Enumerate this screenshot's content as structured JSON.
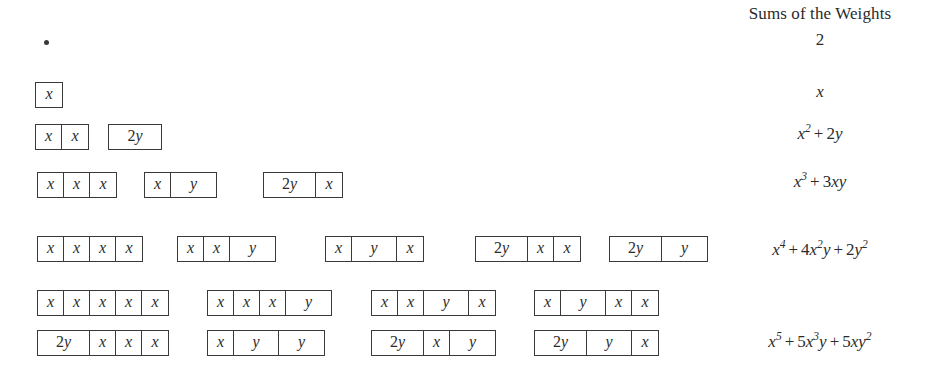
{
  "header": {
    "sums_title": "Sums of the Weights"
  },
  "tile_labels": {
    "x": "x",
    "y": "y",
    "2y_num": "2",
    "2y_var": "y"
  },
  "rows": [
    {
      "id": "row-empty",
      "top": 40,
      "empty_tiling": true,
      "dot_left": 44,
      "groups": [],
      "sum": {
        "top": 30,
        "parts": [
          {
            "type": "mn",
            "text": "2"
          }
        ]
      }
    },
    {
      "id": "row-n1",
      "top": 82,
      "left": 35,
      "groups": [
        {
          "left": 0,
          "cells": [
            "x"
          ]
        }
      ],
      "sum": {
        "top": 82,
        "parts": [
          {
            "type": "mi",
            "text": "x"
          }
        ]
      }
    },
    {
      "id": "row-n2",
      "top": 124,
      "left": 35,
      "groups": [
        {
          "left": 0,
          "cells": [
            "x",
            "x"
          ]
        },
        {
          "left": 73,
          "cells": [
            "2y"
          ]
        }
      ],
      "sum": {
        "top": 124,
        "parts": [
          {
            "type": "mi",
            "text": "x",
            "sup": "2"
          },
          {
            "type": "op",
            "text": "+"
          },
          {
            "type": "mn",
            "text": "2"
          },
          {
            "type": "mi",
            "text": "y"
          }
        ]
      }
    },
    {
      "id": "row-n3",
      "top": 172,
      "left": 37,
      "groups": [
        {
          "left": 0,
          "cells": [
            "x",
            "x",
            "x"
          ]
        },
        {
          "left": 107,
          "cells": [
            "x",
            "y"
          ]
        },
        {
          "left": 226,
          "cells": [
            "2y",
            "x"
          ]
        }
      ],
      "sum": {
        "top": 172,
        "parts": [
          {
            "type": "mi",
            "text": "x",
            "sup": "3"
          },
          {
            "type": "op",
            "text": "+"
          },
          {
            "type": "mn",
            "text": "3"
          },
          {
            "type": "mi",
            "text": "xy"
          }
        ]
      }
    },
    {
      "id": "row-n4",
      "top": 236,
      "left": 37,
      "groups": [
        {
          "left": 0,
          "cells": [
            "x",
            "x",
            "x",
            "x"
          ]
        },
        {
          "left": 140,
          "cells": [
            "x",
            "x",
            "y"
          ]
        },
        {
          "left": 288,
          "cells": [
            "x",
            "y",
            "x"
          ]
        },
        {
          "left": 438,
          "cells": [
            "2y",
            "x",
            "x"
          ]
        },
        {
          "left": 572,
          "cells": [
            "2y",
            "y"
          ]
        }
      ],
      "sum": {
        "top": 240,
        "parts": [
          {
            "type": "mi",
            "text": "x",
            "sup": "4"
          },
          {
            "type": "op",
            "text": "+"
          },
          {
            "type": "mn",
            "text": "4"
          },
          {
            "type": "mi",
            "text": "x",
            "sup": "2"
          },
          {
            "type": "mi",
            "text": "y"
          },
          {
            "type": "op",
            "text": "+"
          },
          {
            "type": "mn",
            "text": "2"
          },
          {
            "type": "mi",
            "text": "y",
            "sup": "2"
          }
        ]
      }
    },
    {
      "id": "row-n5a",
      "top": 290,
      "left": 37,
      "groups": [
        {
          "left": 0,
          "cells": [
            "x",
            "x",
            "x",
            "x",
            "x"
          ]
        },
        {
          "left": 170,
          "cells": [
            "x",
            "x",
            "x",
            "y"
          ]
        },
        {
          "left": 334,
          "cells": [
            "x",
            "x",
            "y",
            "x"
          ]
        },
        {
          "left": 497,
          "cells": [
            "x",
            "y",
            "x",
            "x"
          ]
        }
      ]
    },
    {
      "id": "row-n5b",
      "top": 330,
      "left": 37,
      "groups": [
        {
          "left": 0,
          "cells": [
            "2y",
            "x",
            "x",
            "x"
          ]
        },
        {
          "left": 170,
          "cells": [
            "x",
            "y",
            "y"
          ]
        },
        {
          "left": 334,
          "cells": [
            "2y",
            "x",
            "y"
          ]
        },
        {
          "left": 497,
          "cells": [
            "2y",
            "y",
            "x"
          ]
        }
      ],
      "sum": {
        "top": 332,
        "parts": [
          {
            "type": "mi",
            "text": "x",
            "sup": "5"
          },
          {
            "type": "op",
            "text": "+"
          },
          {
            "type": "mn",
            "text": "5"
          },
          {
            "type": "mi",
            "text": "x",
            "sup": "3"
          },
          {
            "type": "mi",
            "text": "y"
          },
          {
            "type": "op",
            "text": "+"
          },
          {
            "type": "mn",
            "text": "5"
          },
          {
            "type": "mi",
            "text": "xy",
            "sup": "2"
          }
        ]
      }
    }
  ]
}
